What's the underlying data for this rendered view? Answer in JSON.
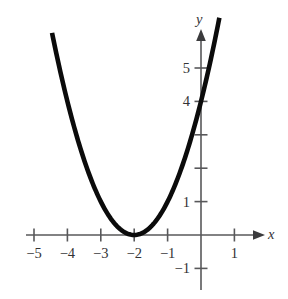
{
  "figure": {
    "background_color": "#ffffff",
    "curve_color": "#0b0b0b",
    "axis_color": "#58585a",
    "label_color": "#333335"
  },
  "axes": {
    "x_axis_label": "x",
    "y_axis_label": "y",
    "origin_px": {
      "x": 201,
      "y": 235
    },
    "unit_px": 33.4,
    "x_arrow": "right",
    "y_arrow": "up"
  },
  "x_ticks": [
    {
      "value": -5,
      "label": "−5",
      "labeled": true
    },
    {
      "value": -4,
      "label": "−4",
      "labeled": true
    },
    {
      "value": -3,
      "label": "−3",
      "labeled": true
    },
    {
      "value": -2,
      "label": "−2",
      "labeled": true
    },
    {
      "value": -1,
      "label": "−1",
      "labeled": true
    },
    {
      "value": 1,
      "label": "1",
      "labeled": true
    }
  ],
  "y_ticks": [
    {
      "value": -1,
      "label": "−1",
      "labeled": true
    },
    {
      "value": 1,
      "label": "1",
      "labeled": true
    },
    {
      "value": 2,
      "label": "",
      "labeled": false
    },
    {
      "value": 3,
      "label": "",
      "labeled": false
    },
    {
      "value": 4,
      "label": "4",
      "labeled": true
    },
    {
      "value": 5,
      "label": "5",
      "labeled": true
    }
  ],
  "chart_data": {
    "type": "line",
    "title": "",
    "subtitle": "",
    "xlabel": "x",
    "ylabel": "y",
    "xlim": [
      -5.6,
      1.6
    ],
    "ylim": [
      -1.6,
      6.3
    ],
    "grid": false,
    "legend": null,
    "series": [
      {
        "name": "y = (x + 2)^2",
        "equation": "y = (x + 2)^2",
        "vertex": [
          -2,
          0
        ],
        "y_intercept": 4,
        "x_domain_drawn": [
          -4.46,
          0.55
        ],
        "x": [
          -4.46,
          -4.25,
          -4.0,
          -3.75,
          -3.5,
          -3.25,
          -3.0,
          -2.75,
          -2.5,
          -2.25,
          -2.0,
          -1.75,
          -1.5,
          -1.25,
          -1.0,
          -0.75,
          -0.5,
          -0.25,
          0.0,
          0.25,
          0.5,
          0.55
        ],
        "values": [
          6.05,
          5.06,
          4.0,
          3.06,
          2.25,
          1.56,
          1.0,
          0.56,
          0.25,
          0.06,
          0.0,
          0.06,
          0.25,
          0.56,
          1.0,
          1.56,
          2.25,
          3.06,
          4.0,
          5.06,
          6.25,
          6.5
        ]
      }
    ],
    "annotations": [
      {
        "text": "−5",
        "axis": "x",
        "value": -5
      },
      {
        "text": "−4",
        "axis": "x",
        "value": -4
      },
      {
        "text": "−3",
        "axis": "x",
        "value": -3
      },
      {
        "text": "−2",
        "axis": "x",
        "value": -2
      },
      {
        "text": "−1",
        "axis": "x",
        "value": -1
      },
      {
        "text": "1",
        "axis": "x",
        "value": 1
      },
      {
        "text": "−1",
        "axis": "y",
        "value": -1
      },
      {
        "text": "1",
        "axis": "y",
        "value": 1
      },
      {
        "text": "4",
        "axis": "y",
        "value": 4
      },
      {
        "text": "5",
        "axis": "y",
        "value": 5
      }
    ]
  }
}
